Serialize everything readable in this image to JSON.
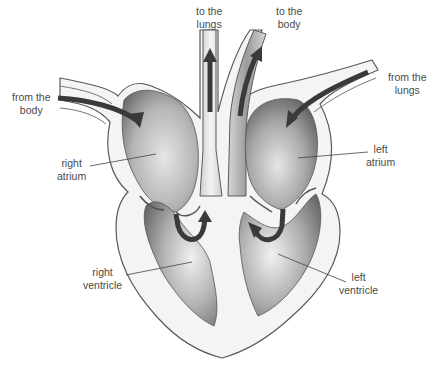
{
  "diagram": {
    "labels": {
      "to_lungs": {
        "line1": "to the",
        "line2": "lungs"
      },
      "to_body": {
        "line1": "to the",
        "line2": "body"
      },
      "from_body": {
        "line1": "from the",
        "line2": "body"
      },
      "from_lungs": {
        "line1": "from the",
        "line2": "lungs"
      },
      "right_atrium": {
        "line1": "right",
        "line2": "atrium"
      },
      "left_atrium": {
        "line1": "left",
        "line2": "atrium"
      },
      "right_ventricle": {
        "line1": "right",
        "line2": "ventricle"
      },
      "left_ventricle": {
        "line1": "left",
        "line2": "ventricle"
      }
    },
    "colors": {
      "tissue": "#f4f4f4",
      "outline": "#555555",
      "chamber_dark": "#5a5a5a",
      "chamber_light": "#d8d8d8",
      "arrow": "#3a3a3a",
      "text": "#4a4a4a"
    }
  }
}
